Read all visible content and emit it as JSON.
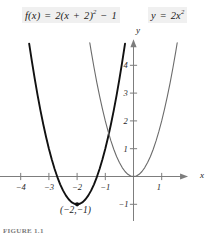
{
  "figure": {
    "caption": "FIGURE 1.1",
    "vertex_label": "(−2,−1)",
    "axis_x_name": "x",
    "axis_y_name": "y",
    "label_background": "#f0f0f0"
  },
  "equations": {
    "left": {
      "name": "f(x)",
      "full": "f(x) = 2(x + 2)² − 1",
      "lhs": "f(x)",
      "eq": "=",
      "coeff": "2(x",
      "plus": "+",
      "inner": "2)",
      "exponent": "2",
      "minus": "−",
      "constant": "1",
      "color": "#111111"
    },
    "right": {
      "name": "y",
      "full": "y = 2x²",
      "lhs": "y",
      "eq": "=",
      "coeff": "2x",
      "exponent": "2",
      "color": "#6b6b6b"
    }
  },
  "chart_data": {
    "type": "line",
    "title": "",
    "xlabel": "x",
    "ylabel": "y",
    "xlim": [
      -4.8,
      1.9
    ],
    "ylim": [
      -1.6,
      4.9
    ],
    "grid": false,
    "legend": "inline-labels",
    "xticks": [
      -4,
      -3,
      -2,
      -1,
      1
    ],
    "xtick_labels": [
      "−4",
      "−3",
      "−2",
      "−1",
      "1"
    ],
    "yticks": [
      -1,
      1,
      2,
      3,
      4
    ],
    "ytick_labels": [
      "−1",
      "1",
      "2",
      "3",
      "4"
    ],
    "annotations": [
      {
        "label": "(−2,−1)",
        "x": -2,
        "y": -1,
        "marker": "dot"
      }
    ],
    "series": [
      {
        "name": "f(x) = 2(x + 2)² − 1",
        "color": "#111111",
        "width": 1.9,
        "vertex": [
          -2,
          -1
        ],
        "a": 2,
        "points": [
          [
            -3.7,
            4.78
          ],
          [
            -3.6,
            4.12
          ],
          [
            -3.5,
            3.5
          ],
          [
            -3.4,
            2.92
          ],
          [
            -3.3,
            2.38
          ],
          [
            -3.2,
            1.88
          ],
          [
            -3.1,
            1.42
          ],
          [
            -3.0,
            1.0
          ],
          [
            -2.9,
            0.62
          ],
          [
            -2.8,
            0.28
          ],
          [
            -2.7,
            -0.02
          ],
          [
            -2.6,
            -0.28
          ],
          [
            -2.5,
            -0.5
          ],
          [
            -2.4,
            -0.68
          ],
          [
            -2.3,
            -0.82
          ],
          [
            -2.2,
            -0.92
          ],
          [
            -2.1,
            -0.98
          ],
          [
            -2.0,
            -1.0
          ],
          [
            -1.9,
            -0.98
          ],
          [
            -1.8,
            -0.92
          ],
          [
            -1.7,
            -0.82
          ],
          [
            -1.6,
            -0.68
          ],
          [
            -1.5,
            -0.5
          ],
          [
            -1.4,
            -0.28
          ],
          [
            -1.3,
            -0.02
          ],
          [
            -1.2,
            0.28
          ],
          [
            -1.1,
            0.62
          ],
          [
            -1.0,
            1.0
          ],
          [
            -0.9,
            1.42
          ],
          [
            -0.8,
            1.88
          ],
          [
            -0.7,
            2.38
          ],
          [
            -0.6,
            2.92
          ],
          [
            -0.5,
            3.5
          ],
          [
            -0.4,
            4.12
          ],
          [
            -0.3,
            4.78
          ]
        ]
      },
      {
        "name": "y = 2x²",
        "color": "#6b6b6b",
        "width": 1.1,
        "vertex": [
          0,
          0
        ],
        "a": 2,
        "points": [
          [
            -1.55,
            4.81
          ],
          [
            -1.5,
            4.5
          ],
          [
            -1.4,
            3.92
          ],
          [
            -1.3,
            3.38
          ],
          [
            -1.2,
            2.88
          ],
          [
            -1.1,
            2.42
          ],
          [
            -1.0,
            2.0
          ],
          [
            -0.9,
            1.62
          ],
          [
            -0.8,
            1.28
          ],
          [
            -0.7,
            0.98
          ],
          [
            -0.6,
            0.72
          ],
          [
            -0.5,
            0.5
          ],
          [
            -0.4,
            0.32
          ],
          [
            -0.3,
            0.18
          ],
          [
            -0.2,
            0.08
          ],
          [
            -0.1,
            0.02
          ],
          [
            0.0,
            0.0
          ],
          [
            0.1,
            0.02
          ],
          [
            0.2,
            0.08
          ],
          [
            0.3,
            0.18
          ],
          [
            0.4,
            0.32
          ],
          [
            0.5,
            0.5
          ],
          [
            0.6,
            0.72
          ],
          [
            0.7,
            0.98
          ],
          [
            0.8,
            1.28
          ],
          [
            0.9,
            1.62
          ],
          [
            1.0,
            2.0
          ],
          [
            1.1,
            2.42
          ],
          [
            1.2,
            2.88
          ],
          [
            1.3,
            3.38
          ],
          [
            1.4,
            3.92
          ],
          [
            1.5,
            4.5
          ],
          [
            1.55,
            4.81
          ]
        ]
      }
    ]
  }
}
